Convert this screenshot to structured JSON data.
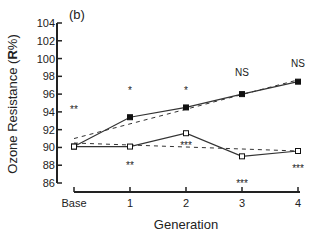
{
  "chart_data": {
    "type": "line",
    "panel_label": "(b)",
    "title": "",
    "xlabel": "Generation",
    "ylabel_prefix": "Ozone Resistance (",
    "ylabel_bold": "R",
    "ylabel_suffix": "%)",
    "categories": [
      "Base",
      "1",
      "2",
      "3",
      "4"
    ],
    "ylim": [
      86,
      104
    ],
    "yticks": [
      86,
      88,
      90,
      92,
      94,
      96,
      98,
      100,
      102,
      104
    ],
    "grid": false,
    "legend": null,
    "series": [
      {
        "name": "Selected for resistance (filled squares)",
        "marker": "filled-square",
        "values": [
          90.1,
          93.4,
          94.5,
          96.0,
          97.4
        ],
        "trend_line": {
          "style": "dashed",
          "start": 91.0,
          "end": 97.6
        }
      },
      {
        "name": "Control (open squares)",
        "marker": "open-square",
        "values": [
          90.1,
          90.1,
          91.6,
          89.0,
          89.6
        ],
        "trend_line": {
          "style": "dashed",
          "start": 90.5,
          "end": 89.6
        }
      }
    ],
    "annotations": [
      {
        "text": "**",
        "x": "Base",
        "y": 94.3
      },
      {
        "text": "*",
        "x": "1",
        "y": 96.5
      },
      {
        "text": "**",
        "x": "1",
        "y": 88.0
      },
      {
        "text": "*",
        "x": "2",
        "y": 96.5
      },
      {
        "text": "***",
        "x": "2",
        "y": 90.3
      },
      {
        "text": "NS",
        "x": "3",
        "y": 98.5
      },
      {
        "text": "***",
        "x": "3",
        "y": 86.0
      },
      {
        "text": "NS",
        "x": "4",
        "y": 99.5
      },
      {
        "text": "***",
        "x": "4",
        "y": 87.7
      }
    ]
  }
}
